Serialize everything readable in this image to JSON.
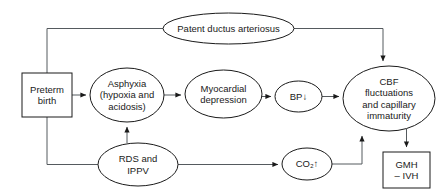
{
  "diagram": {
    "nodes": [
      {
        "id": "pda",
        "shape": "ellipse",
        "label": "Patent ductus arteriosus",
        "x": 228.5,
        "y": 28.5,
        "rx": 65.5,
        "ry": 15.5
      },
      {
        "id": "preterm_birth",
        "shape": "rect",
        "label": "Preterm\nbirth",
        "x": 22,
        "y": 73,
        "w": 50,
        "h": 44
      },
      {
        "id": "asphyxia",
        "shape": "ellipse",
        "label": "Asphyxia\n(hypoxia and\nacidosis)",
        "x": 127,
        "y": 95,
        "rx": 37,
        "ry": 27
      },
      {
        "id": "myocardial_depression",
        "shape": "ellipse",
        "label": "Myocardial\ndepression",
        "x": 223.5,
        "y": 94,
        "rx": 38.5,
        "ry": 24
      },
      {
        "id": "bp_down",
        "shape": "ellipse",
        "label": "BP↓",
        "x": 298.5,
        "y": 96.5,
        "rx": 23.5,
        "ry": 15.5
      },
      {
        "id": "cbf",
        "shape": "ellipse",
        "label": "CBF\nfluctuations\nand capillary\nimmaturity",
        "x": 389,
        "y": 98.5,
        "rx": 46,
        "ry": 32.5
      },
      {
        "id": "rds_ippv",
        "shape": "ellipse",
        "label": "RDS and\nIPPV",
        "x": 138,
        "y": 164.5,
        "rx": 40,
        "ry": 21.5
      },
      {
        "id": "co2_up",
        "shape": "ellipse",
        "label": "CO₂↑",
        "x": 307,
        "y": 164,
        "rx": 25,
        "ry": 16
      },
      {
        "id": "gmh_ivh",
        "shape": "rect",
        "label": "GMH\n– IVH",
        "x": 383,
        "y": 152,
        "w": 47,
        "h": 36
      }
    ],
    "edges": [
      {
        "id": "preterm-to-pda",
        "from": "preterm_birth",
        "to": "pda",
        "label": ""
      },
      {
        "id": "preterm-to-asphyxia",
        "from": "preterm_birth",
        "to": "asphyxia",
        "label": ""
      },
      {
        "id": "preterm-to-rds",
        "from": "preterm_birth",
        "to": "rds_ippv",
        "label": ""
      },
      {
        "id": "pda-to-cbf",
        "from": "pda",
        "to": "cbf",
        "label": ""
      },
      {
        "id": "asphyxia-to-myocardial",
        "from": "asphyxia",
        "to": "myocardial_depression",
        "label": ""
      },
      {
        "id": "myocardial-to-bp",
        "from": "myocardial_depression",
        "to": "bp_down",
        "label": ""
      },
      {
        "id": "bp-to-cbf",
        "from": "bp_down",
        "to": "cbf",
        "label": ""
      },
      {
        "id": "rds-to-asphyxia",
        "from": "rds_ippv",
        "to": "asphyxia",
        "label": ""
      },
      {
        "id": "rds-to-co2",
        "from": "rds_ippv",
        "to": "co2_up",
        "label": ""
      },
      {
        "id": "co2-to-cbf",
        "from": "co2_up",
        "to": "cbf",
        "label": ""
      },
      {
        "id": "cbf-to-gmh",
        "from": "cbf",
        "to": "gmh_ivh",
        "label": ""
      }
    ],
    "colors": {
      "node_stroke": "#1a1a1a",
      "node_fill": "#ffffff",
      "edge_stroke": "#555a5e",
      "text": "#1a1a1a",
      "background": "#ffffff"
    }
  }
}
